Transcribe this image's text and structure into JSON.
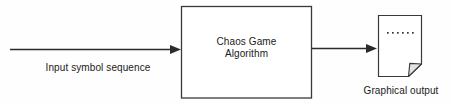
{
  "diagram": {
    "background_color": "#fefefe",
    "stroke_color": "#2b2b2b",
    "fold_fill_color": "#e3e3e3",
    "text_color": "#1a1a1a",
    "input": {
      "label": "Input symbol sequence",
      "arrow_name": "input-arrow"
    },
    "process": {
      "label_line1": "Chaos Game",
      "label_line2": "Algorithm",
      "shape": "rectangle"
    },
    "connector": {
      "arrow_name": "output-arrow"
    },
    "output": {
      "label": "Graphical output",
      "icon": "document-page-icon",
      "dots_count": 6
    }
  }
}
